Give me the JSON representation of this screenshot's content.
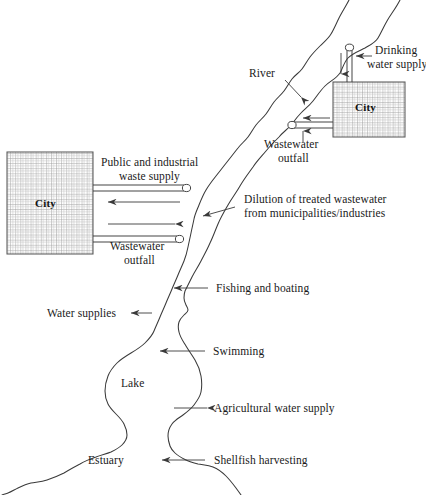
{
  "figure": {
    "type": "schematic-diagram"
  },
  "water_features": {
    "river": {
      "name": "River",
      "label": "River"
    },
    "lake": {
      "name": "Lake",
      "label": "Lake"
    },
    "estuary": {
      "name": "Estuary",
      "label": "Estuary"
    }
  },
  "cities": [
    {
      "id": "city-upstream",
      "label": "City",
      "position": "upper-right"
    },
    {
      "id": "city-downstream",
      "label": "City",
      "position": "mid-left"
    }
  ],
  "annotations": {
    "river": "River",
    "drinking_water_supply": "Drinking\nwater supply",
    "drinking_water_supply_line1": "Drinking",
    "drinking_water_supply_line2": "water supply",
    "wastewater_outfall_upper_line1": "Wastewater",
    "wastewater_outfall_upper_line2": "outfall",
    "public_industrial_line1": "Public and industrial",
    "public_industrial_line2": "waste supply",
    "dilution_line1": "Dilution of treated wastewater",
    "dilution_line2": "from municipalities/industries",
    "wastewater_outfall_lower_line1": "Wastewater",
    "wastewater_outfall_lower_line2": "outfall",
    "fishing_and_boating": "Fishing and boating",
    "water_supplies": "Water supplies",
    "swimming": "Swimming",
    "lake": "Lake",
    "agricultural_water_supply": "Agricultural water supply",
    "estuary": "Estuary",
    "shellfish_harvesting": "Shellfish harvesting"
  },
  "colors": {
    "stroke": "#3a3a3a",
    "text": "#1a1a1a",
    "grid": "#8d8d8d",
    "grid_minor": "#b5b5b5",
    "background": "#ffffff",
    "pipe_fill": "#ffffff"
  }
}
